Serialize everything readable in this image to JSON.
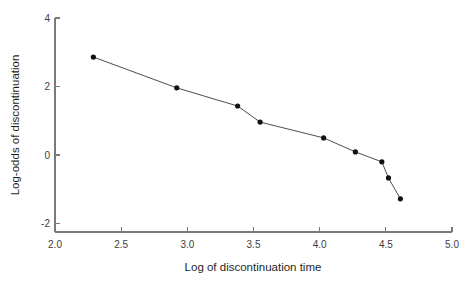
{
  "chart_data": {
    "type": "line",
    "title": "",
    "subtitle": "",
    "xlabel": "Log of discontinuation time",
    "ylabel": "Log-odds of discontinuation",
    "xlim": [
      2.0,
      5.0
    ],
    "ylim": [
      -2,
      4
    ],
    "xticks": [
      2.0,
      2.5,
      3.0,
      3.5,
      4.0,
      4.5,
      5.0
    ],
    "xtick_labels": [
      "2.0",
      "2.5",
      "3.0",
      "3.5",
      "4.0",
      "4.5",
      "5.0"
    ],
    "yticks": [
      -2,
      0,
      2,
      4
    ],
    "ytick_labels": [
      "-2",
      "0",
      "2",
      "4"
    ],
    "grid": false,
    "legend": null,
    "legend_position": "none",
    "markers": "filled-circle",
    "series": [
      {
        "name": "log-odds of discontinuation",
        "color": "#111111",
        "x": [
          2.29,
          2.92,
          3.38,
          3.55,
          4.03,
          4.27,
          4.47,
          4.52,
          4.61
        ],
        "y": [
          2.86,
          1.96,
          1.43,
          0.96,
          0.5,
          0.09,
          -0.2,
          -0.67,
          -1.28
        ]
      }
    ],
    "annotations": []
  },
  "axes": {
    "y_axis_label": "Log-odds of discontinuation",
    "x_axis_label": "Log of discontinuation time"
  }
}
